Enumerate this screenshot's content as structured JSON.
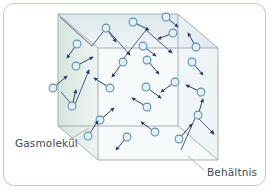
{
  "figure": {
    "title_visible": false,
    "labels": {
      "molecule": "Gasmolekül",
      "container": "Behältnis"
    },
    "colors": {
      "card_border": "#b9d4ae",
      "card_background": "#ffffff",
      "cube_edge": "#8f9a9e",
      "cube_face_left": "#dfe9e4",
      "cube_face_top": "#e3ecef",
      "cube_face_right": "#e7eef1",
      "cube_face_front": "#f1f6f8",
      "molecule_fill": "#e4f0f8",
      "molecule_stroke": "#5b8fb0",
      "arrow": "#24356b",
      "trajectory": "#3a4a78",
      "leader_line": "#9aa7ad",
      "label_text": "#3d4a52"
    },
    "cube": {
      "description": "oblique-projection wireframe box representing the gas container",
      "front_face": [
        [
          98,
          48
        ],
        [
          218,
          48
        ],
        [
          218,
          160
        ],
        [
          98,
          160
        ]
      ],
      "back_face": [
        [
          58,
          14
        ],
        [
          178,
          14
        ],
        [
          178,
          126
        ],
        [
          58,
          126
        ]
      ],
      "depth_vector": [
        -40,
        -34
      ]
    },
    "molecules": [
      {
        "id": 1,
        "x": 106,
        "y": 28,
        "vx": 10,
        "vy": 14
      },
      {
        "id": 2,
        "x": 133,
        "y": 22,
        "vx": 16,
        "vy": 8
      },
      {
        "id": 3,
        "x": 173,
        "y": 33,
        "vx": -15,
        "vy": 6
      },
      {
        "id": 4,
        "x": 143,
        "y": 46,
        "vx": 13,
        "vy": 10
      },
      {
        "id": 5,
        "x": 77,
        "y": 44,
        "vx": -10,
        "vy": 14
      },
      {
        "id": 6,
        "x": 123,
        "y": 62,
        "vx": -11,
        "vy": 15
      },
      {
        "id": 7,
        "x": 147,
        "y": 60,
        "vx": 12,
        "vy": 14
      },
      {
        "id": 8,
        "x": 196,
        "y": 47,
        "vx": -8,
        "vy": -14
      },
      {
        "id": 9,
        "x": 76,
        "y": 66,
        "vx": 17,
        "vy": -9
      },
      {
        "id": 10,
        "x": 110,
        "y": 88,
        "vx": -16,
        "vy": -10
      },
      {
        "id": 11,
        "x": 146,
        "y": 87,
        "vx": 15,
        "vy": 11
      },
      {
        "id": 12,
        "x": 175,
        "y": 82,
        "vx": -14,
        "vy": 10
      },
      {
        "id": 13,
        "x": 201,
        "y": 92,
        "vx": -15,
        "vy": -7
      },
      {
        "id": 14,
        "x": 72,
        "y": 106,
        "vx": 4,
        "vy": -16
      },
      {
        "id": 15,
        "x": 100,
        "y": 120,
        "vx": 14,
        "vy": -12
      },
      {
        "id": 16,
        "x": 147,
        "y": 107,
        "vx": -15,
        "vy": -9
      },
      {
        "id": 17,
        "x": 88,
        "y": 136,
        "vx": 10,
        "vy": -15
      },
      {
        "id": 18,
        "x": 127,
        "y": 137,
        "vx": -11,
        "vy": 13
      },
      {
        "id": 19,
        "x": 155,
        "y": 132,
        "vx": -14,
        "vy": -10
      },
      {
        "id": 20,
        "x": 179,
        "y": 139,
        "vx": 13,
        "vy": -15
      },
      {
        "id": 21,
        "x": 192,
        "y": 62,
        "vx": 11,
        "vy": 13
      },
      {
        "id": 22,
        "x": 53,
        "y": 88,
        "vx": 14,
        "vy": -12
      },
      {
        "id": 23,
        "x": 198,
        "y": 115,
        "vx": 5,
        "vy": -16
      },
      {
        "id": 24,
        "x": 166,
        "y": 17,
        "vx": 12,
        "vy": 10
      }
    ],
    "trajectories": [
      {
        "id": "t1",
        "points": [
          [
            60,
            17
          ],
          [
            92,
            46
          ],
          [
            106,
            28
          ],
          [
            130,
            55
          ]
        ]
      },
      {
        "id": "t2",
        "points": [
          [
            124,
            58
          ],
          [
            146,
            30
          ],
          [
            172,
            53
          ]
        ]
      },
      {
        "id": "t3",
        "points": [
          [
            61,
            92
          ],
          [
            74,
            107
          ],
          [
            89,
            70
          ]
        ]
      },
      {
        "id": "t4",
        "points": [
          [
            181,
            150
          ],
          [
            196,
            116
          ],
          [
            214,
            134
          ]
        ]
      }
    ],
    "leaders": [
      {
        "id": "leader-molecule",
        "from": [
          70,
          139
        ],
        "to": [
          89,
          128
        ]
      },
      {
        "id": "leader-container",
        "from": [
          204,
          170
        ],
        "to": [
          188,
          156
        ]
      }
    ]
  }
}
